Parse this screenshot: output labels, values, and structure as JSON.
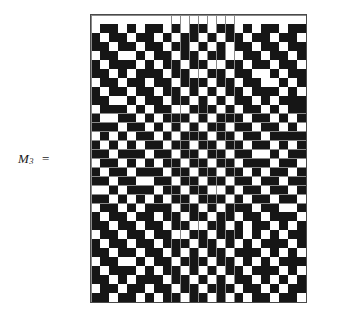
{
  "figure": {
    "label": {
      "symbol": "M",
      "subscript": "3",
      "equals": "="
    },
    "colors": {
      "cell_on": "#161616",
      "cell_off": "#ffffff",
      "grid_line": "#8a8a8a",
      "border": "#4a4a4a",
      "background": "#ffffff",
      "text": "#1a1a1a"
    },
    "layout": {
      "grid_left": 90,
      "grid_top": 14,
      "grid_width": 217,
      "grid_height": 289,
      "cell_size": 9.04
    }
  },
  "chart_data": {
    "type": "heatmap",
    "title": "",
    "xlabel": "",
    "ylabel": "",
    "rows": 32,
    "cols": 24,
    "value_legend": {
      "0": "white cell",
      "1": "black cell"
    },
    "matrix": [
      [
        0,
        0,
        0,
        0,
        0,
        0,
        0,
        0,
        0,
        0,
        0,
        0,
        0,
        0,
        0,
        0,
        0,
        0,
        0,
        0,
        0,
        0,
        0,
        0
      ],
      [
        0,
        1,
        1,
        0,
        1,
        0,
        1,
        1,
        0,
        1,
        0,
        1,
        1,
        0,
        1,
        1,
        0,
        1,
        0,
        1,
        1,
        0,
        1,
        1
      ],
      [
        1,
        0,
        1,
        1,
        0,
        1,
        1,
        0,
        1,
        0,
        1,
        1,
        0,
        1,
        0,
        1,
        1,
        0,
        1,
        1,
        0,
        1,
        1,
        0
      ],
      [
        1,
        1,
        0,
        1,
        1,
        0,
        1,
        1,
        0,
        1,
        1,
        0,
        1,
        0,
        1,
        0,
        1,
        1,
        0,
        1,
        1,
        0,
        1,
        1
      ],
      [
        0,
        1,
        1,
        0,
        0,
        1,
        0,
        1,
        1,
        0,
        1,
        1,
        0,
        1,
        1,
        0,
        0,
        1,
        1,
        0,
        1,
        1,
        0,
        1
      ],
      [
        1,
        0,
        1,
        1,
        1,
        0,
        1,
        0,
        1,
        1,
        0,
        1,
        1,
        0,
        0,
        1,
        1,
        0,
        1,
        1,
        0,
        1,
        1,
        0
      ],
      [
        1,
        1,
        0,
        1,
        0,
        1,
        1,
        1,
        0,
        1,
        1,
        0,
        0,
        1,
        1,
        0,
        1,
        1,
        0,
        0,
        1,
        0,
        1,
        1
      ],
      [
        0,
        1,
        1,
        0,
        1,
        1,
        0,
        1,
        1,
        0,
        1,
        1,
        1,
        0,
        1,
        1,
        0,
        1,
        1,
        0,
        0,
        1,
        0,
        1
      ],
      [
        1,
        0,
        1,
        1,
        0,
        1,
        1,
        0,
        1,
        1,
        0,
        1,
        0,
        1,
        0,
        1,
        1,
        0,
        1,
        1,
        1,
        0,
        1,
        0
      ],
      [
        1,
        1,
        0,
        0,
        1,
        0,
        1,
        1,
        0,
        1,
        1,
        0,
        1,
        0,
        1,
        0,
        1,
        1,
        0,
        1,
        0,
        1,
        1,
        1
      ],
      [
        0,
        1,
        1,
        1,
        0,
        1,
        0,
        1,
        1,
        0,
        0,
        1,
        1,
        1,
        0,
        1,
        0,
        1,
        1,
        0,
        1,
        0,
        1,
        1
      ],
      [
        1,
        0,
        0,
        1,
        1,
        0,
        1,
        0,
        1,
        1,
        1,
        0,
        1,
        0,
        1,
        1,
        1,
        0,
        1,
        1,
        0,
        1,
        0,
        1
      ],
      [
        1,
        1,
        1,
        0,
        1,
        1,
        0,
        1,
        0,
        1,
        0,
        1,
        0,
        1,
        1,
        0,
        1,
        1,
        0,
        1,
        1,
        0,
        1,
        0
      ],
      [
        0,
        1,
        0,
        1,
        0,
        1,
        1,
        0,
        1,
        0,
        1,
        1,
        1,
        0,
        1,
        1,
        0,
        1,
        1,
        0,
        1,
        1,
        1,
        1
      ],
      [
        1,
        0,
        1,
        0,
        1,
        0,
        1,
        1,
        0,
        1,
        1,
        0,
        1,
        1,
        0,
        1,
        1,
        0,
        1,
        1,
        0,
        1,
        0,
        1
      ],
      [
        1,
        1,
        0,
        1,
        1,
        1,
        0,
        1,
        1,
        0,
        1,
        1,
        0,
        1,
        1,
        0,
        1,
        1,
        0,
        0,
        1,
        0,
        1,
        1
      ],
      [
        0,
        1,
        1,
        0,
        1,
        0,
        1,
        0,
        1,
        1,
        0,
        1,
        1,
        0,
        1,
        1,
        0,
        1,
        1,
        1,
        0,
        1,
        1,
        0
      ],
      [
        1,
        0,
        1,
        1,
        0,
        1,
        1,
        1,
        0,
        1,
        1,
        0,
        1,
        1,
        0,
        1,
        1,
        0,
        1,
        0,
        1,
        1,
        0,
        1
      ],
      [
        1,
        1,
        0,
        1,
        1,
        0,
        0,
        1,
        1,
        0,
        1,
        1,
        0,
        1,
        1,
        0,
        1,
        1,
        0,
        1,
        1,
        0,
        1,
        1
      ],
      [
        0,
        0,
        1,
        0,
        1,
        1,
        1,
        0,
        1,
        1,
        0,
        1,
        1,
        0,
        0,
        1,
        0,
        1,
        1,
        0,
        1,
        1,
        0,
        1
      ],
      [
        1,
        1,
        0,
        1,
        0,
        1,
        0,
        1,
        0,
        1,
        1,
        0,
        1,
        1,
        1,
        0,
        1,
        0,
        1,
        1,
        0,
        1,
        1,
        0
      ],
      [
        0,
        1,
        1,
        0,
        1,
        0,
        1,
        1,
        1,
        0,
        1,
        1,
        0,
        1,
        0,
        1,
        1,
        1,
        0,
        1,
        1,
        0,
        0,
        1
      ],
      [
        1,
        0,
        1,
        1,
        0,
        1,
        1,
        0,
        1,
        1,
        0,
        1,
        1,
        0,
        1,
        1,
        0,
        1,
        1,
        0,
        1,
        1,
        1,
        0
      ],
      [
        1,
        1,
        0,
        1,
        1,
        0,
        1,
        1,
        0,
        1,
        1,
        0,
        0,
        1,
        1,
        0,
        1,
        0,
        1,
        1,
        0,
        1,
        0,
        1
      ],
      [
        0,
        1,
        1,
        0,
        1,
        1,
        0,
        1,
        1,
        0,
        0,
        1,
        1,
        0,
        1,
        1,
        1,
        0,
        1,
        0,
        1,
        0,
        1,
        1
      ],
      [
        1,
        0,
        1,
        1,
        0,
        1,
        1,
        0,
        1,
        1,
        1,
        0,
        1,
        1,
        0,
        1,
        0,
        1,
        0,
        1,
        1,
        1,
        0,
        1
      ],
      [
        1,
        1,
        0,
        1,
        1,
        0,
        1,
        1,
        0,
        1,
        0,
        1,
        0,
        1,
        1,
        0,
        1,
        1,
        1,
        0,
        1,
        0,
        1,
        0
      ],
      [
        0,
        1,
        1,
        0,
        0,
        1,
        0,
        1,
        1,
        0,
        1,
        1,
        1,
        0,
        1,
        1,
        0,
        1,
        0,
        1,
        0,
        1,
        1,
        1
      ],
      [
        1,
        0,
        1,
        1,
        1,
        0,
        1,
        0,
        1,
        1,
        0,
        1,
        0,
        1,
        0,
        1,
        1,
        0,
        1,
        1,
        1,
        0,
        1,
        0
      ],
      [
        1,
        1,
        0,
        1,
        0,
        1,
        1,
        1,
        0,
        1,
        1,
        0,
        1,
        0,
        1,
        0,
        1,
        1,
        0,
        1,
        0,
        1,
        0,
        1
      ],
      [
        0,
        1,
        1,
        0,
        1,
        1,
        0,
        1,
        1,
        0,
        1,
        1,
        0,
        1,
        1,
        1,
        0,
        1,
        1,
        0,
        1,
        0,
        1,
        1
      ],
      [
        1,
        1,
        0,
        1,
        1,
        0,
        1,
        0,
        1,
        1,
        0,
        1,
        1,
        0,
        1,
        0,
        1,
        0,
        1,
        1,
        0,
        1,
        1,
        0
      ]
    ]
  }
}
